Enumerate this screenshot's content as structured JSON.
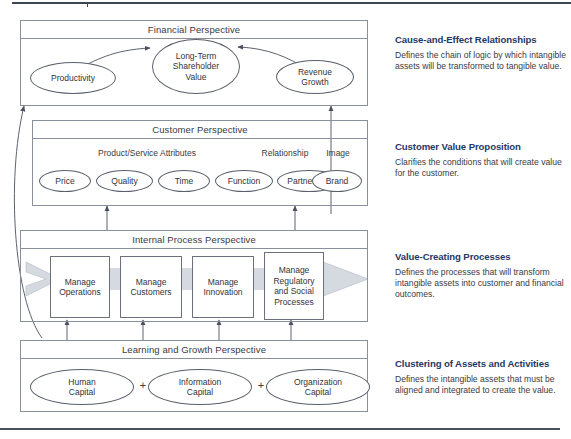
{
  "diagram": {
    "perspectives": [
      {
        "id": "financial",
        "title": "Financial Perspective",
        "nodes": [
          {
            "label": "Productivity"
          },
          {
            "label": "Long-Term\nShareholder\nValue"
          },
          {
            "label": "Revenue\nGrowth"
          }
        ]
      },
      {
        "id": "customer",
        "title": "Customer Perspective",
        "group_labels": [
          "Product/Service Attributes",
          "Relationship",
          "Image"
        ],
        "nodes": [
          {
            "label": "Price"
          },
          {
            "label": "Quality"
          },
          {
            "label": "Time"
          },
          {
            "label": "Function"
          },
          {
            "label": "Partnership"
          },
          {
            "label": "Brand"
          }
        ]
      },
      {
        "id": "internal-process",
        "title": "Internal Process Perspective",
        "nodes": [
          {
            "label": "Manage\nOperations"
          },
          {
            "label": "Manage\nCustomers"
          },
          {
            "label": "Manage\nInnovation"
          },
          {
            "label": "Manage\nRegulatory\nand Social\nProcesses"
          }
        ]
      },
      {
        "id": "learning-growth",
        "title": "Learning and Growth Perspective",
        "nodes": [
          {
            "label": "Human\nCapital"
          },
          {
            "label": "Information\nCapital"
          },
          {
            "label": "Organization\nCapital"
          }
        ],
        "separators": [
          "+",
          "+"
        ]
      }
    ]
  },
  "annotations": [
    {
      "title": "Cause-and-Effect Relationships",
      "body": "Defines the chain of logic by which intangible assets will be transformed to tangible value."
    },
    {
      "title": "Customer Value Proposition",
      "body": "Clarifies the conditions that will create value for the customer."
    },
    {
      "title": "Value-Creating Processes",
      "body": "Defines the processes that will transform intangible assets into customer and financial outcomes."
    },
    {
      "title": "Clustering of Assets and Activities",
      "body": "Defines the intangible assets that must be aligned and integrated to create the value."
    }
  ],
  "colors": {
    "annotation_heading": "#1f3864",
    "panel_border": "#8a8f9c",
    "band_fill": "#d5dae1",
    "rule": "#3d4456",
    "text": "#33333a"
  }
}
